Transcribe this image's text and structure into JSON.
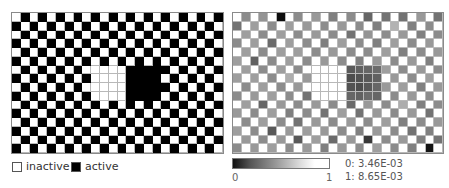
{
  "left_panel": {
    "rows": 16,
    "cols": 24,
    "pattern": "checkerboard, cell active when (row+col) odd",
    "inactive_block": {
      "rows": [
        6,
        9
      ],
      "cols": [
        9,
        12
      ]
    },
    "active_block": {
      "rows": [
        6,
        9
      ],
      "cols": [
        13,
        16
      ]
    },
    "colors": {
      "active": "#000000",
      "inactive": "#ffffff"
    }
  },
  "legend": {
    "inactive_label": "inactive",
    "active_label": "active"
  },
  "right_panel": {
    "rows": 16,
    "cols": 24,
    "values": [
      [
        1,
        0.55,
        1,
        0.58,
        1,
        0.05,
        1,
        0.55,
        1,
        0.6,
        1,
        0.5,
        1,
        0.55,
        1,
        0.4,
        1,
        0.45,
        1,
        0.45,
        1,
        0.6,
        1,
        0.45
      ],
      [
        0.45,
        1,
        0.62,
        1,
        0.55,
        1,
        0.62,
        1,
        0.6,
        1,
        0.55,
        1,
        0.6,
        1,
        0.55,
        1,
        0.5,
        1,
        0.7,
        1,
        0.5,
        1,
        0.55,
        1
      ],
      [
        1,
        0.62,
        1,
        0.55,
        1,
        0.62,
        1,
        0.55,
        1,
        0.6,
        1,
        0.55,
        1,
        0.45,
        1,
        0.58,
        1,
        0.55,
        1,
        0.6,
        1,
        0.5,
        1,
        0.55
      ],
      [
        0.55,
        1,
        0.62,
        1,
        0.42,
        1,
        0.62,
        1,
        0.55,
        1,
        0.5,
        1,
        0.62,
        1,
        0.55,
        1,
        0.5,
        1,
        0.62,
        1,
        0.55,
        1,
        0.6,
        1
      ],
      [
        1,
        0.62,
        1,
        0.55,
        1,
        0.62,
        1,
        0.62,
        1,
        0.55,
        1,
        0.6,
        1,
        0.55,
        1,
        0.55,
        1,
        0.62,
        1,
        0.5,
        1,
        0.55,
        1,
        0.6
      ],
      [
        0.62,
        1,
        0.38,
        1,
        0.55,
        1,
        0.62,
        1,
        0.55,
        1,
        0.6,
        1,
        0.55,
        1,
        0.5,
        1,
        0.6,
        1,
        0.55,
        1,
        0.6,
        1,
        0.5,
        1
      ],
      [
        1,
        0.62,
        1,
        0.55,
        1,
        0.62,
        1,
        0.55,
        1,
        1,
        1,
        1,
        1,
        0.35,
        0.38,
        0.4,
        0.42,
        0.62,
        1,
        0.55,
        1,
        0.6,
        1,
        0.55
      ],
      [
        0.62,
        1,
        0.62,
        1,
        0.55,
        1,
        0.68,
        1,
        0.6,
        1,
        1,
        1,
        1,
        0.3,
        0.32,
        0.35,
        0.38,
        1,
        0.6,
        1,
        0.55,
        1,
        0.62,
        1
      ],
      [
        1,
        0.55,
        1,
        0.62,
        1,
        0.55,
        1,
        0.6,
        1,
        1,
        1,
        1,
        1,
        0.32,
        0.3,
        0.35,
        0.4,
        0.6,
        1,
        0.62,
        1,
        0.5,
        1,
        0.6
      ],
      [
        0.55,
        1,
        0.6,
        1,
        0.62,
        1,
        0.55,
        1,
        0.45,
        1,
        1,
        1,
        1,
        0.4,
        0.38,
        0.42,
        0.4,
        1,
        0.55,
        1,
        0.6,
        1,
        0.55,
        1
      ],
      [
        1,
        0.62,
        1,
        0.4,
        1,
        0.6,
        1,
        0.55,
        1,
        0.6,
        1,
        0.55,
        1,
        0.42,
        1,
        0.6,
        1,
        0.55,
        1,
        0.68,
        1,
        0.5,
        1,
        0.55
      ],
      [
        0.6,
        1,
        0.55,
        1,
        0.62,
        1,
        0.5,
        1,
        0.55,
        1,
        0.45,
        1,
        0.62,
        1,
        0.45,
        1,
        0.6,
        1,
        0.55,
        1,
        0.6,
        1,
        0.45,
        1
      ],
      [
        1,
        0.55,
        1,
        0.62,
        1,
        0.55,
        1,
        0.45,
        1,
        0.6,
        1,
        0.55,
        1,
        0.6,
        1,
        0.55,
        1,
        0.62,
        1,
        0.5,
        1,
        0.55,
        1,
        0.6
      ],
      [
        0.62,
        1,
        0.55,
        1,
        0.35,
        1,
        0.6,
        1,
        0.62,
        1,
        0.6,
        1,
        0.55,
        1,
        0.5,
        1,
        0.6,
        1,
        0.55,
        1,
        0.45,
        1,
        0.5,
        1
      ],
      [
        1,
        0.6,
        1,
        0.55,
        1,
        0.6,
        1,
        0.35,
        1,
        0.62,
        1,
        0.42,
        1,
        0.6,
        1,
        0.22,
        1,
        0.55,
        1,
        0.6,
        1,
        0.5,
        1,
        0.45
      ],
      [
        0.55,
        1,
        0.6,
        1,
        0.62,
        1,
        0.55,
        1,
        0.6,
        1,
        0.5,
        1,
        0.6,
        1,
        0.55,
        1,
        0.62,
        1,
        0.55,
        1,
        0.5,
        1,
        0.08,
        1
      ]
    ]
  },
  "colorbar": {
    "min_label": "0",
    "max_label": "1",
    "range_0": "0: 3.46E-03",
    "range_1": "1: 8.65E-03"
  }
}
